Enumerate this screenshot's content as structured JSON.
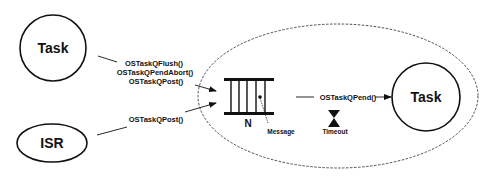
{
  "nodes": {
    "task_sender": {
      "label": "Task"
    },
    "isr": {
      "label": "ISR"
    },
    "task_receiver": {
      "label": "Task"
    },
    "queue": {
      "size_label": "N",
      "message_label": "Message"
    },
    "timeout": {
      "label": "Timeout"
    }
  },
  "edges": {
    "task_to_queue": {
      "labels": [
        "OSTaskQFlush()",
        "OSTaskQPendAbort()",
        "OSTaskQPost()"
      ]
    },
    "isr_to_queue": {
      "label": "OSTaskQPost()"
    },
    "queue_to_task": {
      "label": "OSTaskQPend()"
    }
  },
  "colors": {
    "stroke": "#111111",
    "background": "#ffffff"
  }
}
